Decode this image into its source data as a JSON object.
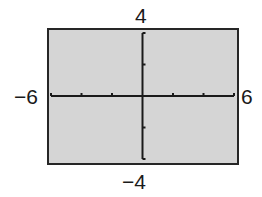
{
  "chart_data": {
    "type": "line",
    "title": "",
    "xlabel": "",
    "ylabel": "",
    "xlim": [
      -6,
      6
    ],
    "ylim": [
      -4,
      4
    ],
    "xscale": 2,
    "yscale": 2,
    "x_ticks": [
      -6,
      -4,
      -2,
      0,
      2,
      4,
      6
    ],
    "y_ticks": [
      -4,
      -2,
      0,
      2,
      4
    ],
    "grid": false,
    "series": [],
    "window_labels": {
      "xmin": "−6",
      "xmax": "6",
      "ymin": "−4",
      "ymax": "4"
    }
  },
  "colors": {
    "plot_background": "#d5d5d5",
    "frame": "#262626",
    "axis": "#1a1a1a",
    "label": "#1a1a1a"
  }
}
